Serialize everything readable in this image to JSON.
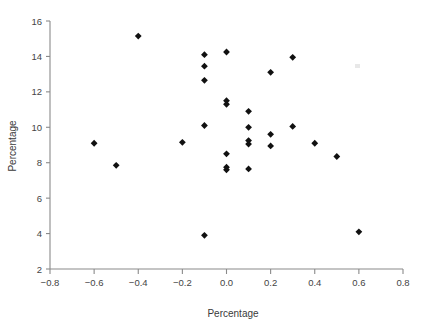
{
  "chart_data": {
    "type": "scatter",
    "title": "",
    "xlabel": "Percentage",
    "ylabel": "Percentage",
    "xlim": [
      -0.8,
      0.8
    ],
    "ylim": [
      2,
      16
    ],
    "xticks": [
      -0.8,
      -0.6,
      -0.4,
      -0.2,
      0.0,
      0.2,
      0.4,
      0.6,
      0.8
    ],
    "xticklabels": [
      "−0.8",
      "−0.6",
      "−0.4",
      "−0.2",
      "0.0",
      "0.2",
      "0.4",
      "0.6",
      "0.8"
    ],
    "yticks": [
      2,
      4,
      6,
      8,
      10,
      12,
      14,
      16
    ],
    "yticklabels": [
      "2",
      "4",
      "6",
      "8",
      "10",
      "12",
      "14",
      "16"
    ],
    "grid": false,
    "legend": null,
    "marker": "diamond",
    "marker_color": "#111111",
    "points": [
      {
        "x": -0.6,
        "y": 9.1
      },
      {
        "x": -0.5,
        "y": 7.85
      },
      {
        "x": -0.4,
        "y": 15.15
      },
      {
        "x": -0.2,
        "y": 9.15
      },
      {
        "x": -0.1,
        "y": 14.1
      },
      {
        "x": -0.1,
        "y": 13.45
      },
      {
        "x": -0.1,
        "y": 12.65
      },
      {
        "x": -0.1,
        "y": 10.1
      },
      {
        "x": -0.1,
        "y": 3.9
      },
      {
        "x": 0.0,
        "y": 14.25
      },
      {
        "x": 0.0,
        "y": 11.5
      },
      {
        "x": 0.0,
        "y": 11.3
      },
      {
        "x": 0.0,
        "y": 8.5
      },
      {
        "x": 0.0,
        "y": 7.75
      },
      {
        "x": 0.0,
        "y": 7.6
      },
      {
        "x": 0.1,
        "y": 10.9
      },
      {
        "x": 0.1,
        "y": 10.0
      },
      {
        "x": 0.1,
        "y": 9.25
      },
      {
        "x": 0.1,
        "y": 9.05
      },
      {
        "x": 0.1,
        "y": 7.65
      },
      {
        "x": 0.2,
        "y": 13.1
      },
      {
        "x": 0.2,
        "y": 9.6
      },
      {
        "x": 0.2,
        "y": 8.95
      },
      {
        "x": 0.3,
        "y": 13.95
      },
      {
        "x": 0.3,
        "y": 10.05
      },
      {
        "x": 0.4,
        "y": 9.1
      },
      {
        "x": 0.5,
        "y": 8.35
      },
      {
        "x": 0.6,
        "y": 4.1
      }
    ]
  },
  "axes": {
    "x_title": "Percentage",
    "y_title": "Percentage"
  }
}
